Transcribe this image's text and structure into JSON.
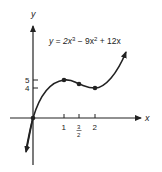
{
  "figure": {
    "equation": "y = 2x³ − 9x² + 12x",
    "equation_parts": {
      "lhs": "y = 2x",
      "exp1": "3",
      "mid": " − 9x",
      "exp2": "2",
      "rhs": " + 12x"
    },
    "x_axis_label": "x",
    "y_axis_label": "y",
    "x_ticks": [
      {
        "value": 1,
        "label": "1"
      },
      {
        "value": 1.5,
        "label_num": "3",
        "label_den": "2"
      },
      {
        "value": 2,
        "label": "2"
      }
    ],
    "y_ticks": [
      {
        "value": 5,
        "label": "5"
      },
      {
        "value": 4,
        "label": "4"
      }
    ],
    "highlighted_points": [
      {
        "x": 0,
        "y": 0
      },
      {
        "x": 1,
        "y": 5
      },
      {
        "x": 1.5,
        "y": 4.5
      },
      {
        "x": 2,
        "y": 4
      }
    ],
    "colors": {
      "ink": "#222222",
      "background": "#ffffff"
    }
  }
}
